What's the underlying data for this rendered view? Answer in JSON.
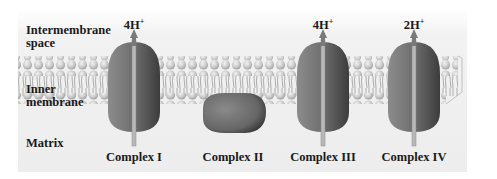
{
  "regions": {
    "intermembrane_line1": "Intermembrane",
    "intermembrane_line2": "space",
    "inner_membrane_line1": "Inner",
    "inner_membrane_line2": "membrane",
    "matrix": "Matrix"
  },
  "complexes": [
    {
      "name": "Complex I",
      "protons": "4H",
      "charge": "+",
      "pumps": true
    },
    {
      "name": "Complex II",
      "protons": "",
      "charge": "",
      "pumps": false
    },
    {
      "name": "Complex III",
      "protons": "4H",
      "charge": "+",
      "pumps": true
    },
    {
      "name": "Complex IV",
      "protons": "2H",
      "charge": "+",
      "pumps": true
    }
  ],
  "colors": {
    "background_top": "#f4f4f4",
    "background_bottom": "#ececec",
    "lipid_head": "#c8c8c8",
    "protein_light": "#8a8a8a",
    "protein_dark": "#4a4a4a",
    "arrow": "#9a9a9a",
    "text": "#1a1a1a"
  }
}
